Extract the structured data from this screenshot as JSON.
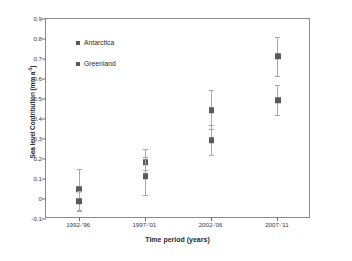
{
  "chart_data": {
    "type": "scatter",
    "title": "",
    "xlabel": "Time period (years)",
    "ylabel": "Sea level Contribution (mm a",
    "ylabel_sup": "-1",
    "ylabel_suffix": ")",
    "categories": [
      "1992-'96",
      "1997-'01",
      "2002-'06",
      "2007-'11"
    ],
    "ylim": [
      -0.1,
      0.9
    ],
    "ytick_labels": [
      "0.9",
      "0.8",
      "0.7",
      "0.6",
      "0.5",
      "0.4",
      "0.3",
      "0.2",
      "0.1",
      "0",
      "-0.1"
    ],
    "ytick_values": [
      0.9,
      0.8,
      0.7,
      0.6,
      0.5,
      0.4,
      0.3,
      0.2,
      0.1,
      0,
      -0.1
    ],
    "grid": false,
    "legend_position": "top-left",
    "series": [
      {
        "name": "Antarctica",
        "color": "#595959",
        "values": [
          0.05,
          0.185,
          0.445,
          0.715
        ],
        "err_low": [
          -0.055,
          0.145,
          0.35,
          0.615
        ],
        "err_high": [
          0.15,
          0.25,
          0.545,
          0.81
        ]
      },
      {
        "name": "Greenland",
        "color": "#595959",
        "values": [
          -0.012,
          0.115,
          0.295,
          0.495
        ],
        "err_low": [
          -0.062,
          0.018,
          0.222,
          0.422
        ],
        "err_high": [
          0.038,
          0.208,
          0.368,
          0.568
        ]
      }
    ]
  },
  "legend": {
    "items": [
      {
        "label": "Antarctica",
        "color": "#595959"
      },
      {
        "label": "Greenland",
        "color": "#595959"
      }
    ]
  },
  "axes": {
    "error_bar_color": "#a9a9a9",
    "frame_color": "#8a8a8a"
  }
}
